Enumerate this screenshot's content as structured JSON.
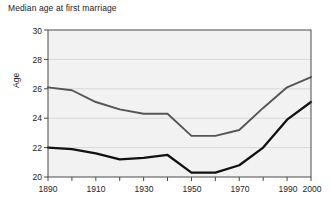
{
  "chart_data": {
    "type": "line",
    "title": "Median age at first marriage",
    "xlabel": "",
    "ylabel": "Age",
    "xlim": [
      1890,
      2000
    ],
    "ylim": [
      20,
      30
    ],
    "yticks": [
      20,
      22,
      24,
      26,
      28,
      30
    ],
    "xticks": [
      1890,
      1900,
      1910,
      1920,
      1930,
      1940,
      1950,
      1960,
      1970,
      1980,
      1990,
      2000
    ],
    "xtick_labels_shown": [
      "1890",
      "1910",
      "1930",
      "1950",
      "1970",
      "1990",
      "2000"
    ],
    "grid": "horizontal",
    "legend": "inline-labels",
    "x": [
      1890,
      1900,
      1910,
      1920,
      1930,
      1940,
      1950,
      1960,
      1970,
      1980,
      1990,
      2000
    ],
    "series": [
      {
        "name": "Male",
        "label": "Male",
        "color": "#555555",
        "values": [
          26.1,
          25.9,
          25.1,
          24.6,
          24.3,
          24.3,
          22.8,
          22.8,
          23.2,
          24.7,
          26.1,
          26.8
        ]
      },
      {
        "name": "Female",
        "label": "Female",
        "color": "#111111",
        "values": [
          22.0,
          21.9,
          21.6,
          21.2,
          21.3,
          21.5,
          20.3,
          20.3,
          20.8,
          22.0,
          23.9,
          25.1
        ]
      }
    ],
    "annotations": [
      {
        "text": "Male",
        "x": 1920,
        "y": 25.0
      },
      {
        "text": "Female",
        "x": 1928,
        "y": 22.1
      }
    ]
  },
  "axis": {
    "y_label": "Age",
    "y_ticks": [
      "30",
      "28",
      "26",
      "24",
      "22",
      "20"
    ],
    "x_ticks": [
      "1890",
      "1910",
      "1930",
      "1950",
      "1970",
      "1990",
      "2000"
    ]
  },
  "colors": {
    "plot_background": "#f2f2f2",
    "plot_border": "#4a4a4a",
    "gridline": "#d8d8d8",
    "male_line": "#555555",
    "female_line": "#111111",
    "text": "#1c1c1c"
  }
}
